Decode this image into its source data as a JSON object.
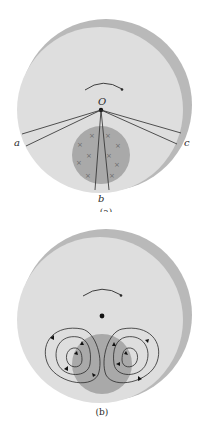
{
  "colors": {
    "disk": "#dedede",
    "disk_edge_shadow": "#b9b9b9",
    "field_region": "#a9a9a9",
    "line": "#2a2a2a",
    "background": "#ffffff"
  },
  "panel_a": {
    "caption": "(a)",
    "center_label": "O",
    "point_labels": {
      "a": "a",
      "b": "b",
      "c": "c"
    },
    "field_marker_glyph": "×",
    "field_marker_count": 10,
    "rotation_arrow": "clockwise"
  },
  "panel_b": {
    "caption": "(b)",
    "rotation_arrow": "clockwise",
    "eddy_current_loops": {
      "left": 3,
      "right": 3
    }
  }
}
